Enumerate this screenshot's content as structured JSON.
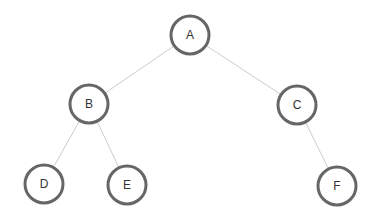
{
  "diagram": {
    "type": "binary-tree",
    "colors": {
      "background": "#ffffff",
      "node_fill": "#ffffff",
      "node_stroke": "#666666",
      "edge": "#cccccc",
      "label": "#333333"
    },
    "node_radius": 19,
    "nodes": [
      {
        "id": "A",
        "label": "A",
        "x": 190,
        "y": 35
      },
      {
        "id": "B",
        "label": "B",
        "x": 89,
        "y": 104
      },
      {
        "id": "C",
        "label": "C",
        "x": 297,
        "y": 105
      },
      {
        "id": "D",
        "label": "D",
        "x": 44,
        "y": 184
      },
      {
        "id": "E",
        "label": "E",
        "x": 127,
        "y": 185
      },
      {
        "id": "F",
        "label": "F",
        "x": 337,
        "y": 186
      }
    ],
    "edges": [
      {
        "from": "A",
        "to": "B"
      },
      {
        "from": "A",
        "to": "C"
      },
      {
        "from": "B",
        "to": "D"
      },
      {
        "from": "B",
        "to": "E"
      },
      {
        "from": "C",
        "to": "F"
      }
    ]
  }
}
